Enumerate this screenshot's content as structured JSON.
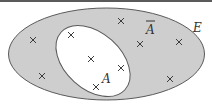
{
  "diagram": {
    "type": "venn",
    "universe": {
      "label": "E",
      "fill": "#cecece",
      "stroke": "#5a5a5a"
    },
    "set": {
      "label": "A",
      "fill": "#ffffff",
      "stroke": "#5a5a5a"
    },
    "complement": {
      "label": "A",
      "overline": true
    },
    "cross_color": "#3c3c3c",
    "elements_in_A": [
      [
        71,
        35
      ],
      [
        91,
        59
      ],
      [
        121,
        68
      ],
      [
        96,
        87
      ]
    ],
    "elements_in_complement": [
      [
        33,
        40
      ],
      [
        42,
        76
      ],
      [
        121,
        21
      ],
      [
        140,
        44
      ],
      [
        179,
        42
      ],
      [
        170,
        79
      ]
    ]
  },
  "labels": {
    "universe": "E",
    "set": "A",
    "complement": "A"
  }
}
